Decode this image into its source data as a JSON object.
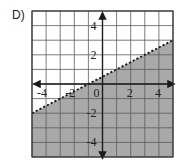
{
  "problem": {
    "label": "D)"
  },
  "colors": {
    "shade": "#a9a9a9",
    "grid_line": "#5a5a5a",
    "axis": "#1a1a1a",
    "boundary": "#1a1a1a",
    "background": "#ffffff"
  },
  "chart_data": {
    "type": "inequality-graph",
    "title": "",
    "xlabel": "",
    "ylabel": "",
    "xlim": [
      -5,
      5
    ],
    "ylim": [
      -5,
      5
    ],
    "grid": true,
    "grid_step": 1,
    "x_tick_labels": [
      "-4",
      "-2",
      "0",
      "2",
      "4"
    ],
    "x_tick_values": [
      -4,
      -2,
      0,
      2,
      4
    ],
    "y_tick_labels": [
      "4",
      "2",
      "-2",
      "-4"
    ],
    "y_tick_values": [
      4,
      2,
      -2,
      -4
    ],
    "boundary_line": {
      "style": "dashed",
      "slope": 0.5,
      "intercept": 0.5,
      "equation": "y = 0.5x + 0.5",
      "points": [
        [
          -5,
          -2
        ],
        [
          5,
          3
        ]
      ]
    },
    "shaded_region": "below",
    "inequality": "y < 0.5x + 0.5"
  }
}
